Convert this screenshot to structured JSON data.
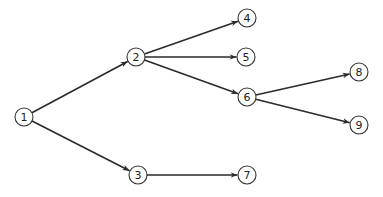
{
  "diagram": {
    "type": "directed-tree",
    "node_radius": 9,
    "colors": {
      "stroke": "#333333",
      "edge": "#2a2a2a",
      "fill": "#ffffff",
      "text": "#222222"
    },
    "nodes": [
      {
        "id": "1",
        "label": "1",
        "x": 24,
        "y": 117
      },
      {
        "id": "2",
        "label": "2",
        "x": 136,
        "y": 57
      },
      {
        "id": "3",
        "label": "3",
        "x": 138,
        "y": 175
      },
      {
        "id": "4",
        "label": "4",
        "x": 247,
        "y": 18
      },
      {
        "id": "5",
        "label": "5",
        "x": 246,
        "y": 57
      },
      {
        "id": "6",
        "label": "6",
        "x": 247,
        "y": 97
      },
      {
        "id": "7",
        "label": "7",
        "x": 247,
        "y": 175
      },
      {
        "id": "8",
        "label": "8",
        "x": 359,
        "y": 72
      },
      {
        "id": "9",
        "label": "9",
        "x": 359,
        "y": 125
      }
    ],
    "edges": [
      {
        "from": "1",
        "to": "2"
      },
      {
        "from": "1",
        "to": "3"
      },
      {
        "from": "2",
        "to": "4"
      },
      {
        "from": "2",
        "to": "5"
      },
      {
        "from": "2",
        "to": "6"
      },
      {
        "from": "3",
        "to": "7"
      },
      {
        "from": "6",
        "to": "8"
      },
      {
        "from": "6",
        "to": "9"
      }
    ]
  }
}
